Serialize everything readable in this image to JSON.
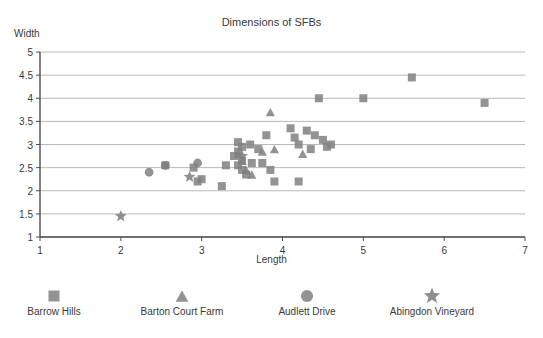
{
  "chart_data": {
    "type": "scatter",
    "title": "Dimensions of SFBs",
    "xlabel": "Length",
    "ylabel": "Width",
    "xlim": [
      1,
      7
    ],
    "ylim": [
      1,
      5
    ],
    "xticks": [
      1,
      2,
      3,
      4,
      5,
      6,
      7
    ],
    "yticks": [
      1,
      1.5,
      2,
      2.5,
      3,
      3.5,
      4,
      4.5,
      5
    ],
    "grid": "horizontal",
    "legend_position": "bottom",
    "marker_color": "#808080",
    "axis_color": "#4d4d4d",
    "grid_color": "#b8b8b8",
    "series": [
      {
        "name": "Barrow Hills",
        "marker": "square",
        "points": [
          [
            2.55,
            2.55
          ],
          [
            2.9,
            2.5
          ],
          [
            3.0,
            2.25
          ],
          [
            2.95,
            2.2
          ],
          [
            3.3,
            2.55
          ],
          [
            3.25,
            2.1
          ],
          [
            3.45,
            3.05
          ],
          [
            3.5,
            2.95
          ],
          [
            3.45,
            2.85
          ],
          [
            3.4,
            2.75
          ],
          [
            3.5,
            2.65
          ],
          [
            3.45,
            2.55
          ],
          [
            3.5,
            2.45
          ],
          [
            3.55,
            2.35
          ],
          [
            3.6,
            3.0
          ],
          [
            3.62,
            2.6
          ],
          [
            3.7,
            2.9
          ],
          [
            3.75,
            2.6
          ],
          [
            3.8,
            3.2
          ],
          [
            3.85,
            2.45
          ],
          [
            3.9,
            2.2
          ],
          [
            4.1,
            3.35
          ],
          [
            4.15,
            3.15
          ],
          [
            4.2,
            3.0
          ],
          [
            4.2,
            2.2
          ],
          [
            4.3,
            3.3
          ],
          [
            4.35,
            2.9
          ],
          [
            4.4,
            3.2
          ],
          [
            4.45,
            4.0
          ],
          [
            4.5,
            3.1
          ],
          [
            4.55,
            2.95
          ],
          [
            4.6,
            3.0
          ],
          [
            5.0,
            4.0
          ],
          [
            5.6,
            4.45
          ],
          [
            6.5,
            3.9
          ]
        ]
      },
      {
        "name": "Barton Court Farm",
        "marker": "triangle",
        "points": [
          [
            3.45,
            2.8
          ],
          [
            3.5,
            2.65
          ],
          [
            3.55,
            2.45
          ],
          [
            3.62,
            2.35
          ],
          [
            3.75,
            2.85
          ],
          [
            3.85,
            3.7
          ],
          [
            3.9,
            2.9
          ],
          [
            4.25,
            2.8
          ]
        ]
      },
      {
        "name": "Audlett Drive",
        "marker": "circle",
        "points": [
          [
            2.35,
            2.4
          ],
          [
            2.55,
            2.55
          ],
          [
            2.95,
            2.6
          ]
        ]
      },
      {
        "name": "Abingdon Vineyard",
        "marker": "star",
        "points": [
          [
            2.0,
            1.45
          ],
          [
            2.85,
            2.3
          ],
          [
            3.5,
            2.75
          ]
        ]
      }
    ]
  },
  "legend": {
    "items": [
      {
        "label": "Barrow Hills",
        "marker": "square"
      },
      {
        "label": "Barton Court Farm",
        "marker": "triangle"
      },
      {
        "label": "Audlett Drive",
        "marker": "circle"
      },
      {
        "label": "Abingdon Vineyard",
        "marker": "star"
      }
    ]
  }
}
